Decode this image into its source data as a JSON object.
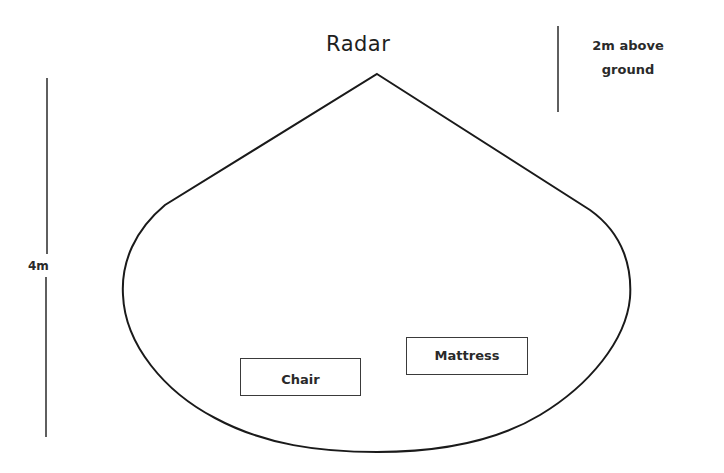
{
  "diagram": {
    "title": "Radar",
    "height_note_line1": "2m above",
    "height_note_line2": "ground",
    "range_label": "4m",
    "objects": [
      {
        "label": "Chair"
      },
      {
        "label": "Mattress"
      }
    ],
    "colors": {
      "stroke": "#1a1a1a",
      "background": "#ffffff"
    }
  }
}
